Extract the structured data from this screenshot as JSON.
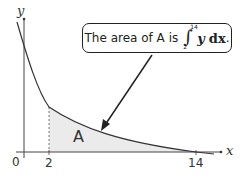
{
  "diagram": {
    "axes": {
      "x_label": "x",
      "y_label": "y",
      "origin_label": "0",
      "ticks": [
        {
          "label": "2",
          "value": 2
        },
        {
          "label": "14",
          "value": 14
        }
      ]
    },
    "region_label": "A",
    "region_fill": "#ebebeb",
    "curve_color": "#333333",
    "callout": {
      "text_prefix": "The area of A is",
      "integral_lower": "2",
      "integral_upper": "14",
      "integrand": "y",
      "differential": "dx",
      "suffix": "."
    }
  }
}
